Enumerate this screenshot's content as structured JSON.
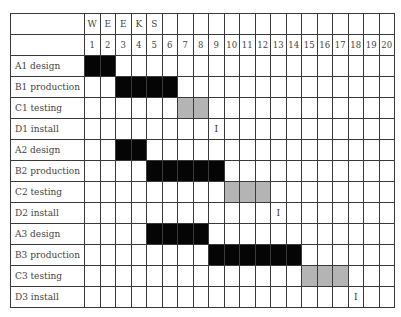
{
  "chart_data": {
    "type": "table",
    "title": "",
    "header_letters": [
      "W",
      "E",
      "E",
      "K",
      "S"
    ],
    "weeks": [
      1,
      2,
      3,
      4,
      5,
      6,
      7,
      8,
      9,
      10,
      11,
      12,
      13,
      14,
      15,
      16,
      17,
      18,
      19,
      20
    ],
    "tasks": [
      {
        "label": "A1 design",
        "kind": "bar",
        "start": 1,
        "end": 2,
        "color": "#050505"
      },
      {
        "label": "B1 production",
        "kind": "bar",
        "start": 3,
        "end": 6,
        "color": "#050505"
      },
      {
        "label": "C1 testing",
        "kind": "bar",
        "start": 7,
        "end": 8,
        "color": "#b4b4b4"
      },
      {
        "label": "D1 install",
        "kind": "milestone",
        "start": 9,
        "end": 9,
        "mark": "I"
      },
      {
        "label": "A2 design",
        "kind": "bar",
        "start": 3,
        "end": 4,
        "color": "#050505"
      },
      {
        "label": "B2 production",
        "kind": "bar",
        "start": 5,
        "end": 9,
        "color": "#050505"
      },
      {
        "label": "C2 testing",
        "kind": "bar",
        "start": 10,
        "end": 12,
        "color": "#b4b4b4"
      },
      {
        "label": "D2 install",
        "kind": "milestone",
        "start": 13,
        "end": 13,
        "mark": "I"
      },
      {
        "label": "A3 design",
        "kind": "bar",
        "start": 5,
        "end": 8,
        "color": "#050505"
      },
      {
        "label": "B3 production",
        "kind": "bar",
        "start": 9,
        "end": 14,
        "color": "#050505"
      },
      {
        "label": "C3 testing",
        "kind": "bar",
        "start": 15,
        "end": 17,
        "color": "#b4b4b4"
      },
      {
        "label": "D3 install",
        "kind": "milestone",
        "start": 18,
        "end": 18,
        "mark": "I"
      }
    ]
  }
}
